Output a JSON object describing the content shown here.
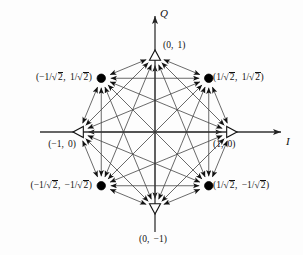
{
  "figure": {
    "type": "constellation-diagram",
    "title": "",
    "modulation": "8-PSK",
    "background_color": "#fdfdfd",
    "line_color": "#333333",
    "marker_fill_color": "#000000",
    "marker_hollow_color": "#ffffff"
  },
  "axes": {
    "x_label": "I",
    "y_label": "Q",
    "x_origin_px": 155,
    "y_origin_px": 132,
    "radius_px": 76
  },
  "points": [
    {
      "id": "p0",
      "label_parts": {
        "open": "(",
        "first": "1",
        "comma": ",",
        "second": "0",
        "close": ")"
      },
      "label_text": "(1,  0)",
      "x": 1.0,
      "y": 0.0,
      "angle_deg": 0,
      "marker": "triangle-right",
      "marker_style": "hollow",
      "label_pos": "right-below"
    },
    {
      "id": "p45",
      "label_text": "(1/√2,  1/√2)",
      "x": 0.7071,
      "y": 0.7071,
      "angle_deg": 45,
      "marker": "circle",
      "marker_style": "filled",
      "label_pos": "right"
    },
    {
      "id": "p90",
      "label_parts": {
        "open": "(",
        "first": "0",
        "comma": ",",
        "second": "1",
        "close": ")"
      },
      "label_text": "(0,  1)",
      "x": 0.0,
      "y": 1.0,
      "angle_deg": 90,
      "marker": "triangle-up",
      "marker_style": "hollow",
      "label_pos": "right"
    },
    {
      "id": "p135",
      "label_text": "(-1/√2,  1/√2)",
      "x": -0.7071,
      "y": 0.7071,
      "angle_deg": 135,
      "marker": "circle",
      "marker_style": "filled",
      "label_pos": "left"
    },
    {
      "id": "p180",
      "label_parts": {
        "open": "(",
        "first": "-1",
        "comma": ",",
        "second": "0",
        "close": ")"
      },
      "label_text": "(-1,  0)",
      "x": -1.0,
      "y": 0.0,
      "angle_deg": 180,
      "marker": "triangle-left",
      "marker_style": "hollow",
      "label_pos": "left-below"
    },
    {
      "id": "p225",
      "label_text": "(-1/√2,  -1/√2)",
      "x": -0.7071,
      "y": -0.7071,
      "angle_deg": 225,
      "marker": "circle",
      "marker_style": "filled",
      "label_pos": "left"
    },
    {
      "id": "p270",
      "label_parts": {
        "open": "(",
        "first": "0",
        "comma": ",",
        "second": "-1",
        "close": ")"
      },
      "label_text": "(0,  -1)",
      "x": 0.0,
      "y": -1.0,
      "angle_deg": 270,
      "marker": "triangle-down",
      "marker_style": "hollow",
      "label_pos": "right-below"
    },
    {
      "id": "p315",
      "label_text": "(1/√2,  -1/√2)",
      "x": 0.7071,
      "y": -0.7071,
      "angle_deg": 315,
      "marker": "circle",
      "marker_style": "filled",
      "label_pos": "right"
    }
  ],
  "label_tokens": {
    "one": "1",
    "neg_one": "-1",
    "zero": "0",
    "slash": "/",
    "sqrt_sign": "√",
    "two": "2",
    "comma": ",",
    "open_paren": "(",
    "close_paren": ")",
    "minus": "−"
  },
  "transitions": {
    "description": "arrows between every pair of constellation points",
    "arrowheads": "both-ends-inward",
    "edge_pairs": [
      [
        0,
        1
      ],
      [
        1,
        2
      ],
      [
        2,
        3
      ],
      [
        3,
        4
      ],
      [
        4,
        5
      ],
      [
        5,
        6
      ],
      [
        6,
        7
      ],
      [
        7,
        0
      ],
      [
        0,
        2
      ],
      [
        1,
        3
      ],
      [
        2,
        4
      ],
      [
        3,
        5
      ],
      [
        4,
        6
      ],
      [
        5,
        7
      ],
      [
        6,
        0
      ],
      [
        7,
        1
      ],
      [
        0,
        3
      ],
      [
        1,
        4
      ],
      [
        2,
        5
      ],
      [
        3,
        6
      ],
      [
        4,
        7
      ],
      [
        5,
        0
      ],
      [
        6,
        1
      ],
      [
        7,
        2
      ],
      [
        0,
        4
      ],
      [
        1,
        5
      ],
      [
        2,
        6
      ],
      [
        3,
        7
      ]
    ]
  }
}
